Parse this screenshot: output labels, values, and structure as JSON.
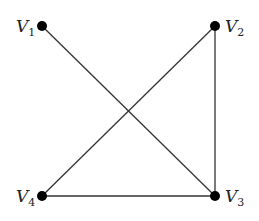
{
  "diagram": {
    "type": "graph",
    "nodes": [
      {
        "id": "V1",
        "letter": "V",
        "sub": "1",
        "x": 42,
        "y": 26
      },
      {
        "id": "V2",
        "letter": "V",
        "sub": "2",
        "x": 215,
        "y": 26
      },
      {
        "id": "V3",
        "letter": "V",
        "sub": "3",
        "x": 215,
        "y": 196
      },
      {
        "id": "V4",
        "letter": "V",
        "sub": "4",
        "x": 42,
        "y": 196
      }
    ],
    "edges": [
      {
        "from": "V1",
        "to": "V3"
      },
      {
        "from": "V2",
        "to": "V4"
      },
      {
        "from": "V2",
        "to": "V3"
      },
      {
        "from": "V4",
        "to": "V3"
      }
    ],
    "colors": {
      "line": "#333333",
      "node": "#000000"
    }
  }
}
